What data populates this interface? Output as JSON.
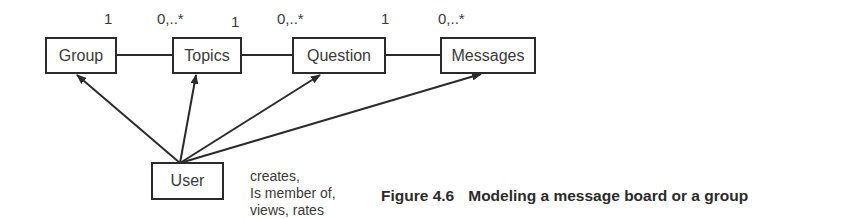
{
  "diagram": {
    "entities": [
      {
        "id": "group",
        "label": "Group"
      },
      {
        "id": "topics",
        "label": "Topics"
      },
      {
        "id": "question",
        "label": "Question"
      },
      {
        "id": "messages",
        "label": "Messages"
      },
      {
        "id": "user",
        "label": "User"
      }
    ],
    "associations": [
      {
        "from": "Group",
        "to": "Topics",
        "from_multiplicity": "1",
        "to_multiplicity": "0,..*"
      },
      {
        "from": "Topics",
        "to": "Question",
        "from_multiplicity": "1",
        "to_multiplicity": "0,..*"
      },
      {
        "from": "Question",
        "to": "Messages",
        "from_multiplicity": "1",
        "to_multiplicity": "0,..*"
      }
    ],
    "user_relations": [
      "Group",
      "Topics",
      "Question",
      "Messages"
    ],
    "multiplicities": {
      "group_topics_left": "1",
      "group_topics_right": "0,..*",
      "topics_question_left": "1",
      "topics_question_right": "0,..*",
      "question_messages_left": "1",
      "question_messages_right": "0,..*"
    },
    "note_lines": [
      "creates,",
      "Is member of,",
      "views, rates"
    ]
  },
  "caption": {
    "number": "Figure 4.6",
    "text": "Modeling a message board or a group"
  }
}
